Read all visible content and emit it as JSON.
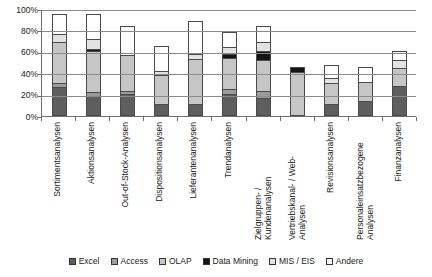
{
  "chart_data": {
    "type": "bar",
    "subtype": "stacked-percent",
    "title": "",
    "xlabel": "",
    "ylabel": "",
    "ylim": [
      0,
      100
    ],
    "yticks": [
      "0%",
      "20%",
      "40%",
      "60%",
      "80%",
      "100%"
    ],
    "ytick_values": [
      0,
      20,
      40,
      60,
      80,
      100
    ],
    "grid": true,
    "legend_position": "bottom",
    "categories": [
      "Sortimentsanalysen",
      "Aktionsanalysen",
      "Out-of-Stock-Analysen",
      "Dispositionsanalysen",
      "Lieferantenanalysen",
      "Trendanalysen",
      "Zielgruppen- / Kundenanalysen",
      "Vertriebskanal- / Web-Analysen",
      "Revisionsanalysen",
      "Personaleinsatzbezogene Analysen",
      "Finanzanalysen"
    ],
    "series": [
      {
        "name": "Excel",
        "color": "#5e5e5e",
        "values": [
          27,
          19,
          21,
          11,
          11,
          21,
          17,
          0,
          11,
          14,
          28
        ]
      },
      {
        "name": "Access",
        "color": "#9b9b9b",
        "values": [
          4,
          3,
          2,
          0,
          0,
          4,
          6,
          0,
          0,
          0,
          0
        ]
      },
      {
        "name": "OLAP",
        "color": "#c6c6c6",
        "values": [
          38,
          39,
          34,
          27,
          42,
          29,
          29,
          41,
          20,
          18,
          17
        ]
      },
      {
        "name": "Data Mining",
        "color": "#141414",
        "values": [
          0,
          2,
          0,
          0,
          0,
          4,
          9,
          5,
          0,
          0,
          0
        ]
      },
      {
        "name": "MIS / EIS",
        "color": "#e2e2e2",
        "values": [
          8,
          9,
          0,
          4,
          5,
          7,
          8,
          0,
          5,
          0,
          7
        ]
      },
      {
        "name": "Andere",
        "color": "#ffffff",
        "values": [
          18,
          23,
          27,
          23,
          31,
          14,
          15,
          0,
          12,
          14,
          9
        ]
      }
    ],
    "totals": [
      95,
      95,
      84,
      65,
      89,
      79,
      84,
      46,
      48,
      46,
      61
    ]
  },
  "legend": {
    "items": [
      {
        "label": "Excel",
        "color": "#5e5e5e"
      },
      {
        "label": "Access",
        "color": "#9b9b9b"
      },
      {
        "label": "OLAP",
        "color": "#c6c6c6"
      },
      {
        "label": "Data Mining",
        "color": "#141414"
      },
      {
        "label": "MIS / EIS",
        "color": "#e2e2e2"
      },
      {
        "label": "Andere",
        "color": "#ffffff"
      }
    ]
  }
}
